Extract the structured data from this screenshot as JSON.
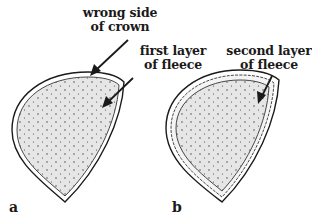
{
  "figure": {
    "panels": [
      {
        "id": "a",
        "label": "a",
        "annotations": [
          {
            "line1": "wrong side",
            "line2": "of crown"
          },
          {
            "line1": "first layer",
            "line2": "of fleece"
          }
        ]
      },
      {
        "id": "b",
        "label": "b",
        "annotations": [
          {
            "line1": "second layer",
            "line2": "of fleece"
          }
        ]
      }
    ]
  },
  "colors": {
    "ink": "#1a1a1a",
    "fill": "#e6e6e6",
    "background": "#ffffff"
  }
}
